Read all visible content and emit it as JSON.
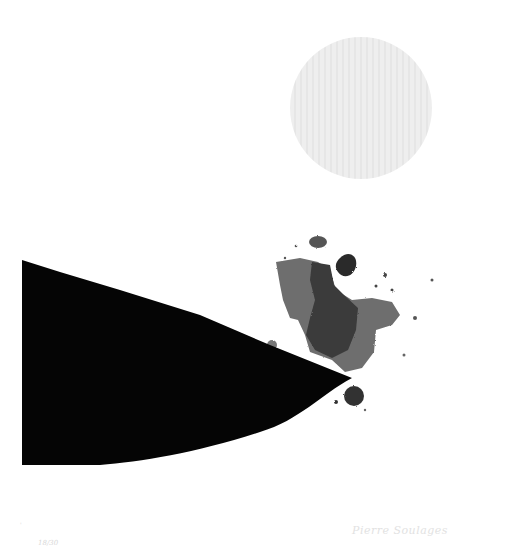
{
  "artwork": {
    "kind": "abstract print",
    "background": "#ffffff",
    "moon": {
      "cx": 361,
      "cy": 108,
      "r": 71,
      "color": "#ececec",
      "grain_color": "#e2e2e2"
    },
    "wedge": {
      "color": "#050505",
      "left_x": 22,
      "top_y": 260,
      "bottom_y": 465,
      "tip": [
        352,
        378
      ]
    },
    "splash": {
      "light": "#6e6e6e",
      "mid": "#4a4a4a",
      "dark": "#2a2a2a"
    }
  },
  "margin_text": {
    "edition": "18/30",
    "signature": "Pierre Soulages",
    "mark": "'"
  }
}
